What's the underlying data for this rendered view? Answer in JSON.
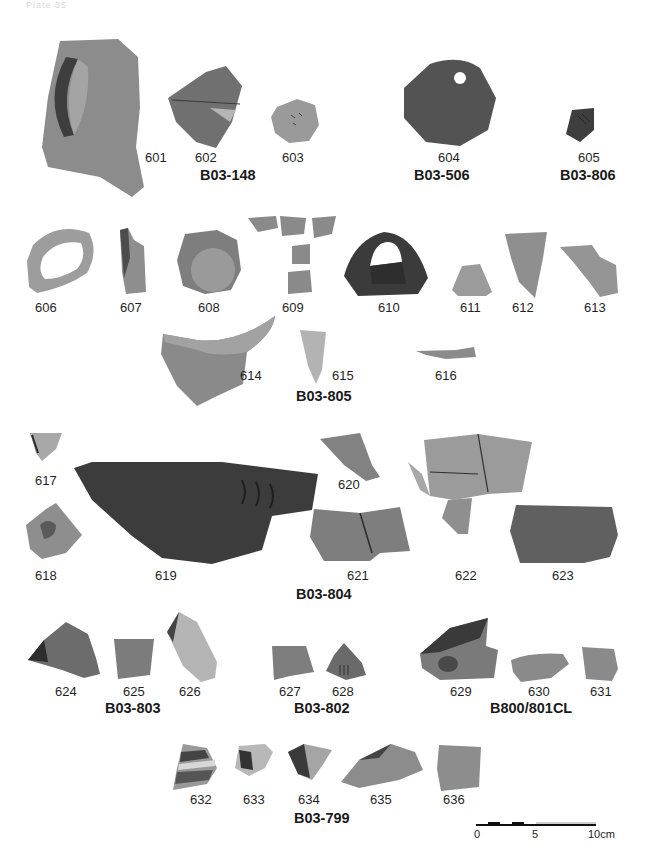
{
  "plate": {
    "header_text": "Plate 35",
    "groups": [
      {
        "id": "B03-148",
        "label": "B03-148"
      },
      {
        "id": "B03-506",
        "label": "B03-506"
      },
      {
        "id": "B03-806",
        "label": "B03-806"
      },
      {
        "id": "B03-805",
        "label": "B03-805"
      },
      {
        "id": "B03-804",
        "label": "B03-804"
      },
      {
        "id": "B03-803",
        "label": "B03-803"
      },
      {
        "id": "B03-802",
        "label": "B03-802"
      },
      {
        "id": "B800/801CL",
        "label": "B800/801CL"
      },
      {
        "id": "B03-799",
        "label": "B03-799"
      }
    ],
    "items": [
      {
        "n": "601"
      },
      {
        "n": "602"
      },
      {
        "n": "603"
      },
      {
        "n": "604"
      },
      {
        "n": "605"
      },
      {
        "n": "606"
      },
      {
        "n": "607"
      },
      {
        "n": "608"
      },
      {
        "n": "609"
      },
      {
        "n": "610"
      },
      {
        "n": "611"
      },
      {
        "n": "612"
      },
      {
        "n": "613"
      },
      {
        "n": "614"
      },
      {
        "n": "615"
      },
      {
        "n": "616"
      },
      {
        "n": "617"
      },
      {
        "n": "618"
      },
      {
        "n": "619"
      },
      {
        "n": "620"
      },
      {
        "n": "621"
      },
      {
        "n": "622"
      },
      {
        "n": "623"
      },
      {
        "n": "624"
      },
      {
        "n": "625"
      },
      {
        "n": "626"
      },
      {
        "n": "627"
      },
      {
        "n": "628"
      },
      {
        "n": "629"
      },
      {
        "n": "630"
      },
      {
        "n": "631"
      },
      {
        "n": "632"
      },
      {
        "n": "633"
      },
      {
        "n": "634"
      },
      {
        "n": "635"
      },
      {
        "n": "636"
      }
    ],
    "scale_bar": {
      "label_0": "0",
      "label_5": "5",
      "label_10": "10cm"
    }
  }
}
